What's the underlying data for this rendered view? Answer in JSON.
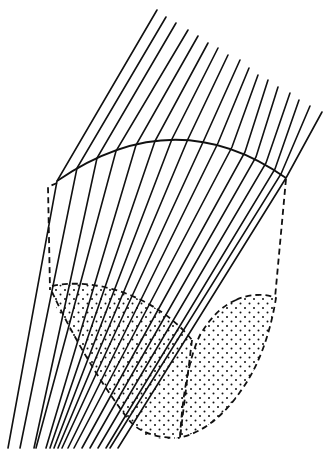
{
  "diagram": {
    "colors": {
      "line": "#111111",
      "background": "#ffffff"
    },
    "rays": [
      {
        "top": [
          157,
          10
        ],
        "hit": [
          57,
          181
        ],
        "bottom": [
          8,
          448
        ]
      },
      {
        "top": [
          166,
          17
        ],
        "hit": [
          77,
          168
        ],
        "bottom": [
          20,
          448
        ]
      },
      {
        "top": [
          176,
          23
        ],
        "hit": [
          97,
          158
        ],
        "bottom": [
          34,
          448
        ]
      },
      {
        "top": [
          188,
          30
        ],
        "hit": [
          116,
          151
        ],
        "bottom": [
          36,
          448
        ]
      },
      {
        "top": [
          198,
          36
        ],
        "hit": [
          136,
          145
        ],
        "bottom": [
          46,
          448
        ]
      },
      {
        "top": [
          208,
          43
        ],
        "hit": [
          155,
          141
        ],
        "bottom": [
          50,
          448
        ]
      },
      {
        "top": [
          218,
          48
        ],
        "hit": [
          172,
          139
        ],
        "bottom": [
          54,
          448
        ]
      },
      {
        "top": [
          228,
          55
        ],
        "hit": [
          188,
          139
        ],
        "bottom": [
          58,
          448
        ]
      },
      {
        "top": [
          240,
          60
        ],
        "hit": [
          204,
          140
        ],
        "bottom": [
          62,
          448
        ]
      },
      {
        "top": [
          249,
          68
        ],
        "hit": [
          218,
          143
        ],
        "bottom": [
          68,
          448
        ]
      },
      {
        "top": [
          258,
          75
        ],
        "hit": [
          232,
          147
        ],
        "bottom": [
          74,
          448
        ]
      },
      {
        "top": [
          268,
          80
        ],
        "hit": [
          245,
          152
        ],
        "bottom": [
          82,
          448
        ]
      },
      {
        "top": [
          278,
          87
        ],
        "hit": [
          256,
          157
        ],
        "bottom": [
          90,
          448
        ]
      },
      {
        "top": [
          290,
          93
        ],
        "hit": [
          266,
          163
        ],
        "bottom": [
          98,
          448
        ]
      },
      {
        "top": [
          299,
          100
        ],
        "hit": [
          275,
          169
        ],
        "bottom": [
          106,
          448
        ]
      },
      {
        "top": [
          310,
          106
        ],
        "hit": [
          281,
          174
        ],
        "bottom": [
          110,
          448
        ]
      },
      {
        "top": [
          322,
          112
        ],
        "hit": [
          286,
          178
        ],
        "bottom": [
          118,
          448
        ]
      }
    ],
    "lens_curve": {
      "start": [
        57,
        181
      ],
      "control": [
        175,
        100
      ],
      "end": [
        286,
        178
      ]
    },
    "outline_left": [
      [
        57,
        181
      ],
      [
        48,
        186
      ],
      [
        50,
        290
      ]
    ],
    "outline_right": [
      [
        286,
        178
      ],
      [
        275,
        298
      ]
    ],
    "region_1": {
      "label": "dotted-region-left"
    },
    "region_2": {
      "label": "dotted-region-right"
    }
  }
}
